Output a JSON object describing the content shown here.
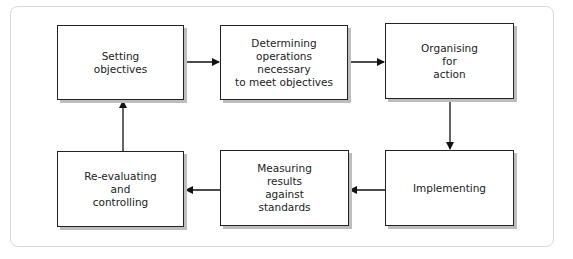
{
  "diagram": {
    "type": "cycle-flowchart",
    "boxes": [
      {
        "id": "b1",
        "label": "Setting\nobjectives"
      },
      {
        "id": "b2",
        "label": "Determining\noperations\nnecessary\nto meet objectives"
      },
      {
        "id": "b3",
        "label": "Organising\nfor\naction"
      },
      {
        "id": "b4",
        "label": "Implementing"
      },
      {
        "id": "b5",
        "label": "Measuring\nresults\nagainst\nstandards"
      },
      {
        "id": "b6",
        "label": "Re-evaluating\nand\ncontrolling"
      }
    ],
    "edges": [
      {
        "from": "b1",
        "to": "b2"
      },
      {
        "from": "b2",
        "to": "b3"
      },
      {
        "from": "b3",
        "to": "b4"
      },
      {
        "from": "b4",
        "to": "b5"
      },
      {
        "from": "b5",
        "to": "b6"
      },
      {
        "from": "b6",
        "to": "b1"
      }
    ],
    "colors": {
      "border": "#222222",
      "shadow": "#bdbdbd",
      "frame": "#d8d8d8"
    }
  }
}
